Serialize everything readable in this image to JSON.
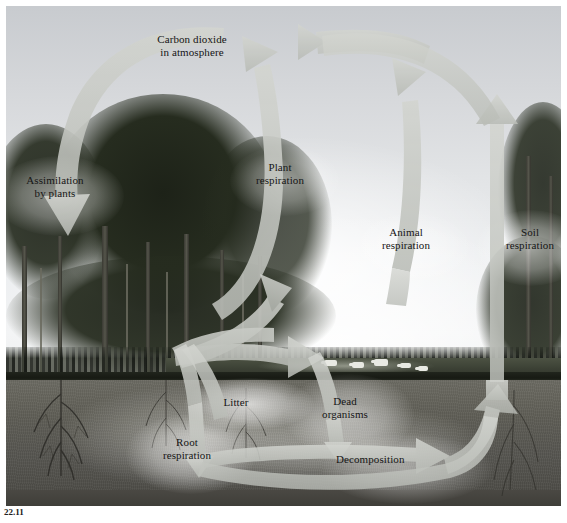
{
  "figure": {
    "caption_number": "22.11",
    "caption_text": "",
    "background_color": "#d9dadc",
    "arrow_color": "#c3c5c0",
    "label_color": "#151515"
  },
  "labels": [
    {
      "id": "carbon-dioxide-in-atmosphere",
      "text": "Carbon dioxide\nin atmosphere",
      "x": 138,
      "y": 27
    },
    {
      "id": "assimilation-by-plants",
      "text": "Assimilation\nby plants",
      "x": 8,
      "y": 168
    },
    {
      "id": "plant-respiration",
      "text": "Plant\nrespiration",
      "x": 244,
      "y": 155
    },
    {
      "id": "animal-respiration",
      "text": "Animal\nrespiration",
      "x": 365,
      "y": 220
    },
    {
      "id": "soil-respiration",
      "text": "Soil\nrespiration",
      "x": 492,
      "y": 220
    },
    {
      "id": "litter",
      "text": "Litter",
      "x": 213,
      "y": 390
    },
    {
      "id": "root-respiration",
      "text": "Root\nrespiration",
      "x": 150,
      "y": 430
    },
    {
      "id": "dead-organisms",
      "text": "Dead\norganisms",
      "x": 310,
      "y": 389
    },
    {
      "id": "decomposition",
      "text": "Decomposition",
      "x": 337,
      "y": 447
    }
  ],
  "flows": [
    {
      "id": "assimilation-arrow",
      "from": "carbon-dioxide-in-atmosphere",
      "to": "plants",
      "direction": "down-left"
    },
    {
      "id": "plant-respiration-arrow",
      "from": "plants",
      "to": "carbon-dioxide-in-atmosphere",
      "direction": "up"
    },
    {
      "id": "animal-respiration-arrow",
      "from": "animals",
      "to": "carbon-dioxide-in-atmosphere",
      "direction": "up"
    },
    {
      "id": "soil-respiration-arrow",
      "from": "soil",
      "to": "carbon-dioxide-in-atmosphere",
      "direction": "up"
    },
    {
      "id": "litter-arrow",
      "from": "plants",
      "to": "litter",
      "direction": "down-right"
    },
    {
      "id": "root-respiration-arrow",
      "from": "plants",
      "to": "roots",
      "direction": "down"
    },
    {
      "id": "dead-organisms-arrow",
      "from": "animals",
      "to": "dead-organisms",
      "direction": "down-left"
    },
    {
      "id": "grazing-arrow",
      "from": "plants",
      "to": "animals",
      "direction": "right"
    },
    {
      "id": "decomposition-arrow",
      "from": "dead-organisms",
      "to": "soil",
      "direction": "right"
    },
    {
      "id": "litter-to-soil-arrow",
      "from": "litter",
      "to": "soil",
      "direction": "right"
    },
    {
      "id": "root-to-soil-arrow",
      "from": "root-respiration",
      "to": "soil",
      "direction": "right"
    }
  ],
  "scene": {
    "sky_label": "sky",
    "ground_label": "soil cross-section",
    "forest_label": "forest canopy",
    "meadow_label": "grazing meadow"
  }
}
